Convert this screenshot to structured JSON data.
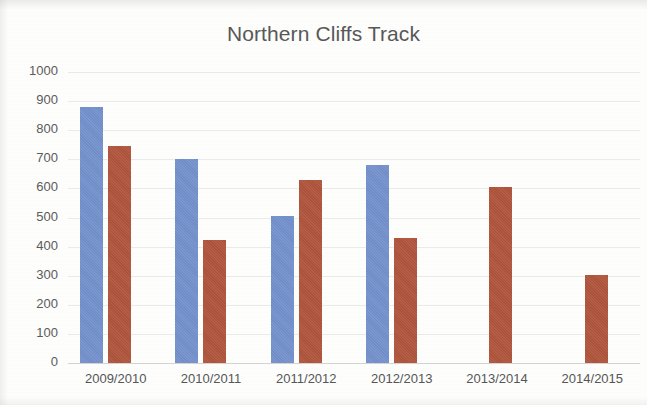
{
  "chart_data": {
    "type": "bar",
    "title": "Northern Cliffs Track",
    "xlabel": "",
    "ylabel": "",
    "categories": [
      "2009/2010",
      "2010/2011",
      "2011/2012",
      "2012/2013",
      "2013/2014",
      "2014/2015"
    ],
    "series": [
      {
        "name": "Series 1",
        "color": "#7491CD",
        "values": [
          880,
          700,
          505,
          680,
          null,
          null
        ]
      },
      {
        "name": "Series 2",
        "color": "#B0543C",
        "values": [
          745,
          423,
          628,
          428,
          605,
          302
        ]
      }
    ],
    "ylim": [
      0,
      1000
    ],
    "ytick_step": 100,
    "yticks": [
      "1000",
      "900",
      "800",
      "700",
      "600",
      "500",
      "400",
      "300",
      "200",
      "100",
      "0"
    ],
    "grid": true,
    "grid_axis": "y",
    "legend": "none",
    "legend_position": "none"
  },
  "colors": {
    "series_a": "#7491CD",
    "series_b": "#B0543C",
    "background": "#fdfdfc",
    "text": "#585858",
    "gridline": "#aaaaaa"
  }
}
